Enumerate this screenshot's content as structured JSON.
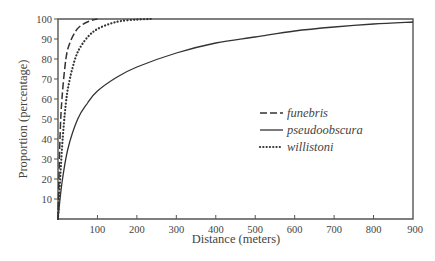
{
  "chart_data": {
    "type": "line",
    "title": "",
    "xlabel": "Distance (meters)",
    "ylabel": "Proportion (percentage)",
    "xlim": [
      0,
      900
    ],
    "ylim": [
      0,
      100
    ],
    "xticks": [
      100,
      200,
      300,
      400,
      500,
      600,
      700,
      800,
      900
    ],
    "yticks": [
      10,
      20,
      30,
      40,
      50,
      60,
      70,
      80,
      90,
      100
    ],
    "grid": false,
    "legend_position": "center-right",
    "series": [
      {
        "name": "funebris",
        "style": "dashed",
        "x": [
          0,
          5,
          10,
          20,
          30,
          45,
          60,
          80,
          100
        ],
        "y": [
          0,
          40,
          60,
          80,
          88,
          94,
          97,
          99,
          100
        ]
      },
      {
        "name": "pseudoobscura",
        "style": "solid",
        "x": [
          0,
          10,
          25,
          50,
          75,
          100,
          150,
          200,
          300,
          400,
          500,
          600,
          700,
          800,
          900
        ],
        "y": [
          0,
          18,
          35,
          50,
          58,
          64,
          71,
          76,
          83,
          88,
          91,
          94,
          96,
          97.5,
          98.5
        ]
      },
      {
        "name": "willistoni",
        "style": "dotted",
        "x": [
          0,
          10,
          20,
          30,
          45,
          60,
          80,
          100,
          130,
          160,
          200,
          235
        ],
        "y": [
          0,
          35,
          58,
          70,
          81,
          87,
          92,
          95,
          97.5,
          99,
          99.7,
          100
        ]
      }
    ]
  }
}
